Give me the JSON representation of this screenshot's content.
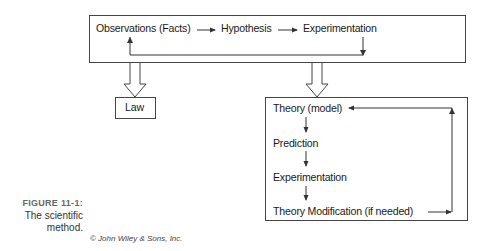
{
  "diagram": {
    "top_box": {
      "observations": "Observations (Facts)",
      "hypothesis": "Hypothesis",
      "experimentation": "Experimentation"
    },
    "law_box": {
      "label": "Law"
    },
    "theory_box": {
      "theory": "Theory (model)",
      "prediction": "Prediction",
      "experimentation": "Experimentation",
      "modification": "Theory Modification (if needed)"
    },
    "colors": {
      "line": "#444444",
      "text": "#1a1a1a",
      "caption_label": "#666666"
    }
  },
  "caption": {
    "figure_label": "FIGURE 11-1:",
    "text_line1": "The scientific",
    "text_line2": "method."
  },
  "credit": "© John Wiley & Sons, Inc."
}
